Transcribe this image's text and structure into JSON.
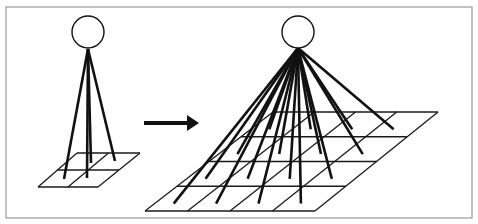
{
  "figure": {
    "frame": {
      "x": 6,
      "y": 7,
      "w": 466,
      "h": 211,
      "stroke": "#9a9a9a"
    },
    "colors": {
      "line": "#111111",
      "grid": "#1a1a1a",
      "background": "#ffffff"
    },
    "left_unit": {
      "circle": {
        "cx": 88,
        "cy": 32,
        "r": 16
      },
      "apex": [
        88,
        49
      ],
      "grid": {
        "rows": 2,
        "cols": 2,
        "tl": [
          77,
          153
        ],
        "tr": [
          140,
          153
        ],
        "bl": [
          38,
          187
        ],
        "br": [
          98,
          187
        ]
      },
      "connections": [
        [
          64,
          179
        ],
        [
          87,
          178
        ],
        [
          91,
          163
        ],
        [
          115,
          161
        ]
      ]
    },
    "arrow": {
      "x1": 144,
      "y1": 123,
      "x2": 199,
      "y2": 123,
      "direction": "right"
    },
    "right_unit": {
      "circle": {
        "cx": 298,
        "cy": 32,
        "r": 16
      },
      "apex": [
        298,
        48
      ],
      "grid": {
        "rows": 4,
        "cols": 4,
        "tl": [
          273,
          112
        ],
        "tr": [
          438,
          112
        ],
        "bl": [
          145,
          211
        ],
        "br": [
          315,
          211
        ]
      },
      "connection_count": 16
    }
  }
}
